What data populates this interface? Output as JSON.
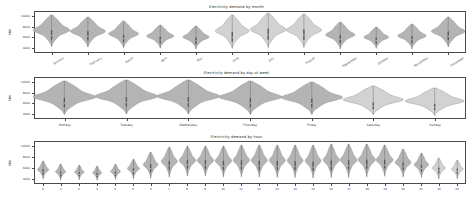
{
  "figure": {
    "background": "#ffffff",
    "axis_color": "#4a4a4a",
    "text_color": "#2b2b2b",
    "violin_fill": "#b4b4b4",
    "violin_edge": "#8c8c8c",
    "violin_fill_light": "#d2d2d2",
    "violin_inner": "#555555"
  },
  "chart_data": [
    {
      "type": "violin",
      "title": "Electricity demand by month",
      "xlabel": "",
      "ylabel": "MW",
      "ylim": [
        3000,
        11000
      ],
      "yticks": [
        4000,
        6000,
        8000,
        10000
      ],
      "ytick_labels": [
        "4000",
        "6000",
        "8000",
        "10000"
      ],
      "grid": false,
      "categories": [
        "January",
        "February",
        "March",
        "April",
        "May",
        "June",
        "July",
        "August",
        "September",
        "October",
        "November",
        "December"
      ],
      "series": [
        {
          "name": "demand",
          "stats": [
            {
              "category": "January",
              "median": 6300,
              "q1": 5500,
              "q3": 7300,
              "min": 4200,
              "max": 10200,
              "width": 1.0,
              "shade": "dark"
            },
            {
              "category": "February",
              "median": 6250,
              "q1": 5450,
              "q3": 7200,
              "min": 4200,
              "max": 9900,
              "width": 0.96,
              "shade": "dark"
            },
            {
              "category": "March",
              "median": 5750,
              "q1": 5100,
              "q3": 6500,
              "min": 4000,
              "max": 9100,
              "width": 0.82,
              "shade": "dark"
            },
            {
              "category": "April",
              "median": 5450,
              "q1": 4850,
              "q3": 6050,
              "min": 3900,
              "max": 8300,
              "width": 0.74,
              "shade": "dark"
            },
            {
              "category": "May",
              "median": 5400,
              "q1": 4800,
              "q3": 6000,
              "min": 3850,
              "max": 8200,
              "width": 0.72,
              "shade": "dark"
            },
            {
              "category": "June",
              "median": 6050,
              "q1": 5200,
              "q3": 7100,
              "min": 3950,
              "max": 10300,
              "width": 0.92,
              "shade": "light"
            },
            {
              "category": "July",
              "median": 6450,
              "q1": 5500,
              "q3": 7600,
              "min": 4050,
              "max": 10600,
              "width": 0.98,
              "shade": "light"
            },
            {
              "category": "August",
              "median": 6400,
              "q1": 5450,
              "q3": 7500,
              "min": 4050,
              "max": 10400,
              "width": 0.96,
              "shade": "light"
            },
            {
              "category": "September",
              "median": 5700,
              "q1": 5000,
              "q3": 6500,
              "min": 3900,
              "max": 9000,
              "width": 0.8,
              "shade": "dark"
            },
            {
              "category": "October",
              "median": 5300,
              "q1": 4750,
              "q3": 5900,
              "min": 3850,
              "max": 7900,
              "width": 0.68,
              "shade": "dark"
            },
            {
              "category": "November",
              "median": 5600,
              "q1": 4950,
              "q3": 6300,
              "min": 3900,
              "max": 8600,
              "width": 0.78,
              "shade": "dark"
            },
            {
              "category": "December",
              "median": 6150,
              "q1": 5400,
              "q3": 7050,
              "min": 4100,
              "max": 9800,
              "width": 0.92,
              "shade": "dark"
            }
          ]
        }
      ]
    },
    {
      "type": "violin",
      "title": "Electricity demand by day of week",
      "xlabel": "",
      "ylabel": "MW",
      "ylim": [
        3000,
        11000
      ],
      "yticks": [
        4000,
        6000,
        8000,
        10000
      ],
      "ytick_labels": [
        "4000",
        "6000",
        "8000",
        "10000"
      ],
      "grid": false,
      "categories": [
        "Monday",
        "Tuesday",
        "Wednesday",
        "Thursday",
        "Friday",
        "Saturday",
        "Sunday"
      ],
      "series": [
        {
          "name": "demand",
          "stats": [
            {
              "category": "Monday",
              "median": 6100,
              "q1": 5300,
              "q3": 7100,
              "min": 3950,
              "max": 10300,
              "width": 1.0,
              "shade": "dark"
            },
            {
              "category": "Tuesday",
              "median": 6150,
              "q1": 5350,
              "q3": 7150,
              "min": 3950,
              "max": 10400,
              "width": 1.0,
              "shade": "dark"
            },
            {
              "category": "Wednesday",
              "median": 6150,
              "q1": 5350,
              "q3": 7150,
              "min": 3950,
              "max": 10400,
              "width": 1.0,
              "shade": "dark"
            },
            {
              "category": "Thursday",
              "median": 6100,
              "q1": 5300,
              "q3": 7100,
              "min": 3950,
              "max": 10300,
              "width": 1.0,
              "shade": "dark"
            },
            {
              "category": "Friday",
              "median": 6000,
              "q1": 5250,
              "q3": 6950,
              "min": 3950,
              "max": 10100,
              "width": 0.98,
              "shade": "dark"
            },
            {
              "category": "Saturday",
              "median": 5500,
              "q1": 4900,
              "q3": 6200,
              "min": 3850,
              "max": 9300,
              "width": 0.96,
              "shade": "light"
            },
            {
              "category": "Sunday",
              "median": 5350,
              "q1": 4800,
              "q3": 6000,
              "min": 3800,
              "max": 9000,
              "width": 0.94,
              "shade": "light"
            }
          ]
        }
      ]
    },
    {
      "type": "violin",
      "title": "Electricity demand by hour",
      "xlabel": "",
      "ylabel": "MW",
      "ylim": [
        3000,
        11000
      ],
      "yticks": [
        4000,
        6000,
        8000,
        10000
      ],
      "ytick_labels": [
        "4000",
        "6000",
        "8000",
        "10000"
      ],
      "grid": false,
      "categories": [
        "0",
        "1",
        "2",
        "3",
        "4",
        "5",
        "6",
        "7",
        "8",
        "9",
        "10",
        "11",
        "12",
        "13",
        "14",
        "15",
        "16",
        "17",
        "18",
        "19",
        "20",
        "21",
        "22",
        "23"
      ],
      "series": [
        {
          "name": "demand",
          "stats": [
            {
              "category": "0",
              "median": 5150,
              "q1": 4700,
              "q3": 5650,
              "min": 3850,
              "max": 7200,
              "width": 0.62,
              "shade": "dark"
            },
            {
              "category": "1",
              "median": 4900,
              "q1": 4500,
              "q3": 5350,
              "min": 3800,
              "max": 6800,
              "width": 0.56,
              "shade": "dark"
            },
            {
              "category": "2",
              "median": 4750,
              "q1": 4400,
              "q3": 5150,
              "min": 3750,
              "max": 6500,
              "width": 0.52,
              "shade": "dark"
            },
            {
              "category": "3",
              "median": 4700,
              "q1": 4350,
              "q3": 5100,
              "min": 3750,
              "max": 6400,
              "width": 0.5,
              "shade": "dark"
            },
            {
              "category": "4",
              "median": 4800,
              "q1": 4450,
              "q3": 5250,
              "min": 3800,
              "max": 6700,
              "width": 0.54,
              "shade": "dark"
            },
            {
              "category": "5",
              "median": 5250,
              "q1": 4800,
              "q3": 5900,
              "min": 3900,
              "max": 7600,
              "width": 0.66,
              "shade": "dark"
            },
            {
              "category": "6",
              "median": 5900,
              "q1": 5300,
              "q3": 6700,
              "min": 4100,
              "max": 9000,
              "width": 0.8,
              "shade": "dark"
            },
            {
              "category": "7",
              "median": 6400,
              "q1": 5700,
              "q3": 7300,
              "min": 4300,
              "max": 9900,
              "width": 0.88,
              "shade": "dark"
            },
            {
              "category": "8",
              "median": 6500,
              "q1": 5800,
              "q3": 7400,
              "min": 4400,
              "max": 10000,
              "width": 0.9,
              "shade": "dark"
            },
            {
              "category": "9",
              "median": 6450,
              "q1": 5750,
              "q3": 7350,
              "min": 4400,
              "max": 10000,
              "width": 0.9,
              "shade": "dark"
            },
            {
              "category": "10",
              "median": 6400,
              "q1": 5700,
              "q3": 7350,
              "min": 4350,
              "max": 10100,
              "width": 0.9,
              "shade": "dark"
            },
            {
              "category": "11",
              "median": 6350,
              "q1": 5650,
              "q3": 7350,
              "min": 4300,
              "max": 10200,
              "width": 0.9,
              "shade": "dark"
            },
            {
              "category": "12",
              "median": 6300,
              "q1": 5600,
              "q3": 7300,
              "min": 4250,
              "max": 10200,
              "width": 0.88,
              "shade": "dark"
            },
            {
              "category": "13",
              "median": 6250,
              "q1": 5550,
              "q3": 7250,
              "min": 4200,
              "max": 10200,
              "width": 0.88,
              "shade": "dark"
            },
            {
              "category": "14",
              "median": 6200,
              "q1": 5500,
              "q3": 7200,
              "min": 4150,
              "max": 10200,
              "width": 0.86,
              "shade": "dark"
            },
            {
              "category": "15",
              "median": 6200,
              "q1": 5500,
              "q3": 7200,
              "min": 4150,
              "max": 10300,
              "width": 0.86,
              "shade": "dark"
            },
            {
              "category": "16",
              "median": 6300,
              "q1": 5600,
              "q3": 7350,
              "min": 4200,
              "max": 10400,
              "width": 0.88,
              "shade": "dark"
            },
            {
              "category": "17",
              "median": 6500,
              "q1": 5800,
              "q3": 7500,
              "min": 4300,
              "max": 10500,
              "width": 0.92,
              "shade": "dark"
            },
            {
              "category": "18",
              "median": 6600,
              "q1": 5900,
              "q3": 7600,
              "min": 4400,
              "max": 10500,
              "width": 0.94,
              "shade": "dark"
            },
            {
              "category": "19",
              "median": 6500,
              "q1": 5850,
              "q3": 7450,
              "min": 4400,
              "max": 10200,
              "width": 0.92,
              "shade": "dark"
            },
            {
              "category": "20",
              "median": 6200,
              "q1": 5600,
              "q3": 7000,
              "min": 4300,
              "max": 9500,
              "width": 0.86,
              "shade": "dark"
            },
            {
              "category": "21",
              "median": 5850,
              "q1": 5300,
              "q3": 6500,
              "min": 4150,
              "max": 8700,
              "width": 0.78,
              "shade": "dark"
            },
            {
              "category": "22",
              "median": 5550,
              "q1": 5050,
              "q3": 6100,
              "min": 4000,
              "max": 7900,
              "width": 0.7,
              "shade": "light"
            },
            {
              "category": "23",
              "median": 5300,
              "q1": 4850,
              "q3": 5800,
              "min": 3900,
              "max": 7400,
              "width": 0.64,
              "shade": "light"
            }
          ]
        }
      ]
    }
  ]
}
